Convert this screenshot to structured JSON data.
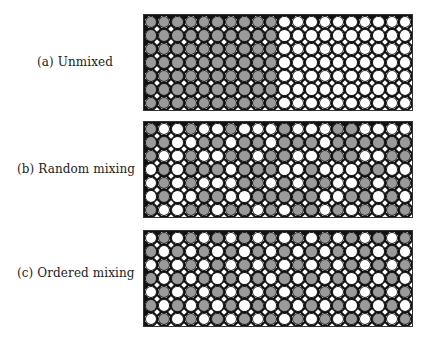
{
  "figure": {
    "panels": [
      {
        "id": "a",
        "label": "(a) Unmixed",
        "rows": [
          "GGGGGGGGGGWWWWWWWWWW",
          "GGGGGGGGGGWWWWWWWWWW",
          "GGGGGGGGGGWWWWWWWWWW",
          "GGGGGGGGGGWWWWWWWWWW",
          "GGGGGGGGGGWWWWWWWWWW",
          "GGGGGGGGGGWWWWWWWWWW",
          "GGGGGGGGGGWWWWWWWWWW"
        ]
      },
      {
        "id": "b",
        "label": "(b) Random mixing",
        "rows": [
          "GWWGWWGWWWGWWWGGWWWW",
          "GGWWGGWGGWGGGWGGGGGG",
          "GWWGWWGGWGGWWGGGWWGG",
          "WGWGGGWGGGWWGWWWGGWW",
          "WGWGWWWGGWGWGGWWGWGG",
          "WGWWGGWWGGGGGWWGGWGW",
          "GWWGGWGGWGWGGWGWGWGG"
        ]
      },
      {
        "id": "c",
        "label": "(c) Ordered mixing",
        "rows": [
          "WGWGWGWGWGWGWGWGWGWG",
          "GWGWGWGWGWGWGWGWGWGW",
          "WGWGWGWGWGWGWGWGWGWG",
          "GWGWGWGWGWGWGWGWGWGW",
          "WGWGWGWGWGWGWGWGWGWG",
          "GWGWGWGWGWGWGWGWGWGW",
          "WGWGWGWGWGWGWGWGWGWG"
        ]
      }
    ],
    "legend": {
      "G": "gray atom",
      "W": "white atom"
    },
    "colors": {
      "gray": "#9a9a9a",
      "white": "#ffffff",
      "outline": "#1a1a1a"
    },
    "grid": {
      "columns": 20,
      "rows": 7
    }
  }
}
